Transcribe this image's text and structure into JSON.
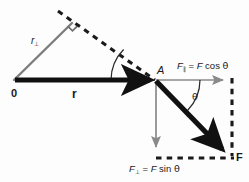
{
  "figure": {
    "type": "vector-diagram",
    "colors": {
      "vector_bold": "#111111",
      "component_gray": "#808080",
      "lever_gray": "#7d7d7d",
      "dashed": "#1a1a1a",
      "background": "#fdfdfd",
      "text": "#1a1a1a"
    }
  },
  "labels": {
    "origin": "0",
    "r_vector": "r",
    "r_perp_base": "r",
    "r_perp_sub": "⊥",
    "point_a": "A",
    "angle_theta_1": "θ",
    "angle_theta_2": "θ",
    "f_parallel_base": "F",
    "f_parallel_sub": "∥",
    "f_parallel_eq": " = ",
    "f_parallel_rhs_f": "F",
    "f_parallel_rhs_fn": " cos ",
    "f_parallel_rhs_theta": "θ",
    "f_perp_base": "F",
    "f_perp_sub": "⊥",
    "f_perp_eq": " = ",
    "f_perp_rhs_f": "F",
    "f_perp_rhs_fn": " sin ",
    "f_perp_rhs_theta": "θ",
    "force_vector": "F"
  },
  "geometry": {
    "origin": {
      "x": 14,
      "y": 80
    },
    "point_a": {
      "x": 155,
      "y": 80
    },
    "r_perp_tip": {
      "x": 72,
      "y": 23
    },
    "dashed_line_far": {
      "x": 58,
      "y": 12
    },
    "force_tip": {
      "x": 228,
      "y": 155
    },
    "parallel_tip": {
      "x": 228,
      "y": 80
    },
    "perp_tip": {
      "x": 155,
      "y": 152
    },
    "rect_corner": {
      "x": 232,
      "y": 158
    },
    "theta_1_deg": 22,
    "theta_2_deg": 45
  }
}
